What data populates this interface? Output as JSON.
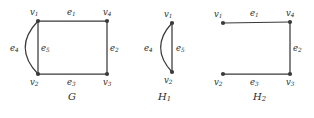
{
  "figure": {
    "width": 314,
    "height": 118,
    "background": "#ffffff",
    "ink_color": "#3a3a3a",
    "text_color": "#2b2b2b"
  },
  "graphs": [
    {
      "id": "G",
      "caption": "G",
      "caption_pos": {
        "x": 68,
        "y": 92
      },
      "vertices": [
        {
          "id": "v1",
          "label": "v",
          "sub": "1",
          "x": 38,
          "y": 21,
          "label_pos": {
            "x": 30,
            "y": 8
          }
        },
        {
          "id": "v2",
          "label": "v",
          "sub": "2",
          "x": 38,
          "y": 74,
          "label_pos": {
            "x": 30,
            "y": 78
          }
        },
        {
          "id": "v3",
          "label": "v",
          "sub": "3",
          "x": 107,
          "y": 74,
          "label_pos": {
            "x": 103,
            "y": 78
          }
        },
        {
          "id": "v4",
          "label": "v",
          "sub": "4",
          "x": 107,
          "y": 21,
          "label_pos": {
            "x": 103,
            "y": 8
          }
        }
      ],
      "edges": [
        {
          "id": "e1",
          "label": "e",
          "sub": "1",
          "from": "v1",
          "to": "v4",
          "type": "straight",
          "label_pos": {
            "x": 67,
            "y": 8
          }
        },
        {
          "id": "e2",
          "label": "e",
          "sub": "2",
          "from": "v4",
          "to": "v3",
          "type": "straight",
          "label_pos": {
            "x": 110,
            "y": 44
          }
        },
        {
          "id": "e3",
          "label": "e",
          "sub": "3",
          "from": "v2",
          "to": "v3",
          "type": "straight",
          "label_pos": {
            "x": 67,
            "y": 78
          }
        },
        {
          "id": "e4",
          "label": "e",
          "sub": "4",
          "from": "v1",
          "to": "v2",
          "type": "curve",
          "bulge": -18,
          "label_pos": {
            "x": 10,
            "y": 44
          }
        },
        {
          "id": "e5",
          "label": "e",
          "sub": "5",
          "from": "v1",
          "to": "v2",
          "type": "straight",
          "label_pos": {
            "x": 41,
            "y": 44
          }
        }
      ]
    },
    {
      "id": "H1",
      "caption": "H",
      "caption_sub": "1",
      "caption_pos": {
        "x": 158,
        "y": 92
      },
      "vertices": [
        {
          "id": "v1",
          "label": "v",
          "sub": "1",
          "x": 172,
          "y": 23,
          "label_pos": {
            "x": 164,
            "y": 10
          }
        },
        {
          "id": "v2",
          "label": "v",
          "sub": "2",
          "x": 172,
          "y": 72,
          "label_pos": {
            "x": 164,
            "y": 76
          }
        }
      ],
      "edges": [
        {
          "id": "e4",
          "label": "e",
          "sub": "4",
          "from": "v1",
          "to": "v2",
          "type": "curve",
          "bulge": -16,
          "label_pos": {
            "x": 144,
            "y": 44
          }
        },
        {
          "id": "e5",
          "label": "e",
          "sub": "5",
          "from": "v1",
          "to": "v2",
          "type": "straight",
          "label_pos": {
            "x": 176,
            "y": 44
          }
        }
      ]
    },
    {
      "id": "H2",
      "caption": "H",
      "caption_sub": "2",
      "caption_pos": {
        "x": 253,
        "y": 92
      },
      "vertices": [
        {
          "id": "v1",
          "label": "v",
          "sub": "1",
          "x": 223,
          "y": 23,
          "label_pos": {
            "x": 214,
            "y": 10
          }
        },
        {
          "id": "v2",
          "label": "v",
          "sub": "2",
          "x": 223,
          "y": 74,
          "label_pos": {
            "x": 214,
            "y": 78
          }
        },
        {
          "id": "v3",
          "label": "v",
          "sub": "3",
          "x": 290,
          "y": 74,
          "label_pos": {
            "x": 286,
            "y": 78
          }
        },
        {
          "id": "v4",
          "label": "v",
          "sub": "4",
          "x": 290,
          "y": 22,
          "label_pos": {
            "x": 286,
            "y": 9
          }
        }
      ],
      "edges": [
        {
          "id": "e1",
          "label": "e",
          "sub": "1",
          "from": "v1",
          "to": "v4",
          "type": "straight",
          "label_pos": {
            "x": 250,
            "y": 9
          }
        },
        {
          "id": "e2",
          "label": "e",
          "sub": "2",
          "from": "v4",
          "to": "v3",
          "type": "straight",
          "label_pos": {
            "x": 293,
            "y": 44
          }
        },
        {
          "id": "e3",
          "label": "e",
          "sub": "3",
          "from": "v2",
          "to": "v3",
          "type": "straight",
          "label_pos": {
            "x": 250,
            "y": 78
          }
        }
      ]
    }
  ]
}
